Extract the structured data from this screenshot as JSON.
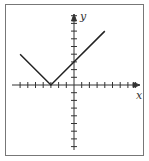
{
  "chart_data": {
    "type": "line",
    "title": "",
    "xlabel": "x",
    "ylabel": "y",
    "function": "y = |x + 3|",
    "x": [
      -7,
      -3,
      4
    ],
    "values": [
      4,
      0,
      7
    ],
    "xlim": [
      -7,
      8
    ],
    "ylim": [
      -8,
      9
    ],
    "tick_step": 1,
    "grid": false,
    "legend": null
  },
  "labels": {
    "x": "x",
    "y": "y"
  },
  "colors": {
    "line": "#222222",
    "axis": "#333333",
    "frame": "#777777"
  }
}
